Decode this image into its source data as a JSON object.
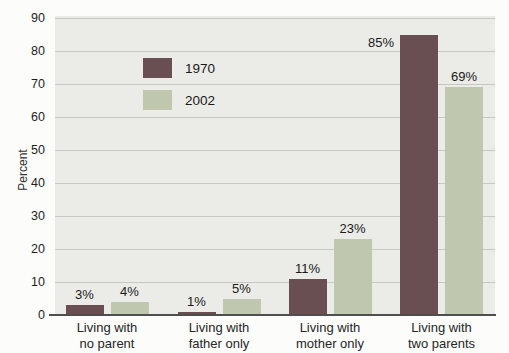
{
  "chart_data": {
    "type": "bar",
    "title": "",
    "ylabel": "Percent",
    "xlabel": "",
    "ylim": [
      0,
      90
    ],
    "yticks": [
      0,
      10,
      20,
      30,
      40,
      50,
      60,
      70,
      80,
      90
    ],
    "grid": true,
    "legend_position": "inside-top-left",
    "categories": [
      "Living with no parent",
      "Living with father only",
      "Living with mother only",
      "Living with two parents"
    ],
    "category_lines": [
      [
        "Living with",
        "no parent"
      ],
      [
        "Living with",
        "father only"
      ],
      [
        "Living with",
        "mother only"
      ],
      [
        "Living with",
        "two parents"
      ]
    ],
    "series": [
      {
        "name": "1970",
        "color": "#6a4f52",
        "values": [
          3,
          1,
          11,
          85
        ],
        "value_labels": [
          "3%",
          "1%",
          "11%",
          "85%"
        ]
      },
      {
        "name": "2002",
        "color": "#bfc7ae",
        "values": [
          4,
          5,
          23,
          69
        ],
        "value_labels": [
          "4%",
          "5%",
          "23%",
          "69%"
        ]
      }
    ]
  },
  "colors": {
    "page_bg": "#fcfcfa",
    "plot_bg": "#ebebe7",
    "gridline": "#c7c7c4",
    "axis_line": "#4f4f4f",
    "text": "#1e1e1e"
  }
}
